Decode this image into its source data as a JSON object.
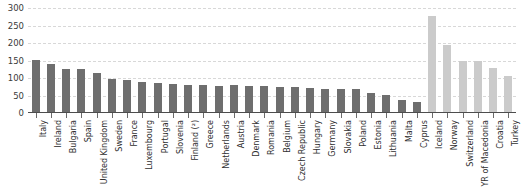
{
  "chart_data": {
    "type": "bar",
    "title": "",
    "subtitle": "",
    "xlabel": "",
    "ylabel": "",
    "ylim": [
      0,
      300
    ],
    "yticks": [
      0,
      50,
      100,
      150,
      200,
      250,
      300
    ],
    "ytick_labels": [
      "0",
      "50",
      "100",
      "150",
      "200",
      "250",
      "300"
    ],
    "grid": true,
    "legend": "none",
    "categories": [
      "Italy",
      "Ireland",
      "Bulgaria",
      "Spain",
      "United Kingdom",
      "Sweden",
      "France",
      "Luxembourg",
      "Portugal",
      "Slovenia",
      "Finland (²)",
      "Greece",
      "Netherlands",
      "Austria",
      "Denmark",
      "Romania",
      "Belgium",
      "Czech Republic",
      "Hungary",
      "Germany",
      "Slovakia",
      "Poland",
      "Estonia",
      "Lithuania",
      "Malta",
      "Cyprus",
      "Iceland",
      "Norway",
      "Switzerland",
      "FYR of Macedonia",
      "Croatia",
      "Turkey"
    ],
    "values": [
      151,
      139,
      127,
      126,
      113,
      98,
      93,
      90,
      87,
      83,
      80,
      79,
      78,
      80,
      77,
      76,
      75,
      75,
      72,
      70,
      70,
      68,
      58,
      52,
      38,
      32,
      277,
      195,
      150,
      150,
      130,
      105
    ],
    "series_groups": [
      {
        "name": "EU Member States",
        "color": "#6e6e6e",
        "from_index": 0,
        "to_index": 25
      },
      {
        "name": "Non-EU countries",
        "color": "#cbcbcb",
        "from_index": 26,
        "to_index": 31
      }
    ],
    "bar_colors": [
      "#6e6e6e",
      "#6e6e6e",
      "#6e6e6e",
      "#6e6e6e",
      "#6e6e6e",
      "#6e6e6e",
      "#6e6e6e",
      "#6e6e6e",
      "#6e6e6e",
      "#6e6e6e",
      "#6e6e6e",
      "#6e6e6e",
      "#6e6e6e",
      "#6e6e6e",
      "#6e6e6e",
      "#6e6e6e",
      "#6e6e6e",
      "#6e6e6e",
      "#6e6e6e",
      "#6e6e6e",
      "#6e6e6e",
      "#6e6e6e",
      "#6e6e6e",
      "#6e6e6e",
      "#6e6e6e",
      "#6e6e6e",
      "#cbcbcb",
      "#cbcbcb",
      "#cbcbcb",
      "#cbcbcb",
      "#cbcbcb",
      "#cbcbcb"
    ]
  },
  "colors": {
    "background": "#ffffff",
    "bar_primary": "#6e6e6e",
    "bar_secondary": "#cbcbcb",
    "gridline": "#d8d8d8",
    "axis": "#4d4d4d",
    "text": "#2f2f2f"
  }
}
